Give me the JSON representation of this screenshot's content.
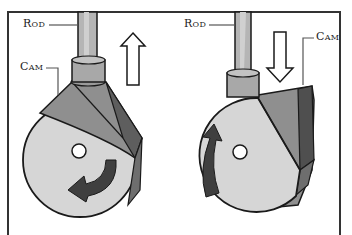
{
  "diagram": {
    "type": "cam-and-rod mechanism illustration",
    "frame": {
      "stroke": "#333333"
    },
    "panels": [
      {
        "id": "left",
        "labels": {
          "rod": "Rod",
          "cam": "Cam"
        },
        "motion_arrow": {
          "direction": "up",
          "meaning": "rod rises"
        },
        "rotation_arrow": {
          "direction": "counterclockwise-bottom"
        },
        "cam_lobe_position": "top (pushing rod up)"
      },
      {
        "id": "right",
        "labels": {
          "rod": "Rod",
          "cam": "Cam"
        },
        "motion_arrow": {
          "direction": "down",
          "meaning": "rod falls"
        },
        "rotation_arrow": {
          "direction": "clockwise-left"
        },
        "cam_lobe_position": "right side (rod on round part)"
      }
    ],
    "colors": {
      "rod": "#b5b5b5",
      "cam_face": "#d6d6d6",
      "cam_lobe_light": "#8f8f8f",
      "cam_lobe_dark": "#5e5e5e",
      "arrow_fill": "#ffffff",
      "rotation_arrow": "#3f3f3f",
      "outline": "#1a1a1a"
    }
  }
}
